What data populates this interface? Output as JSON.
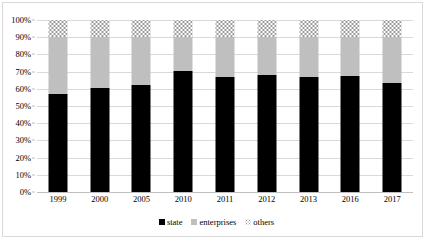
{
  "chart_data": {
    "type": "bar",
    "stacked": true,
    "normalized_percent": true,
    "title": "",
    "subtitle": "",
    "xlabel": "",
    "ylabel": "",
    "ylim": [
      0,
      100
    ],
    "ytick_step": 10,
    "grid": true,
    "legend_position": "bottom",
    "categories": [
      "1999",
      "2000",
      "2005",
      "2010",
      "2011",
      "2012",
      "2013",
      "2016",
      "2017"
    ],
    "ytick_labels": [
      "100%",
      "90%",
      "80%",
      "70%",
      "60%",
      "50%",
      "40%",
      "30%",
      "20%",
      "10%",
      "0%"
    ],
    "ytick_values": [
      100,
      90,
      80,
      70,
      60,
      50,
      40,
      30,
      20,
      10,
      0
    ],
    "series": [
      {
        "name": "state",
        "color": "#000000",
        "pattern": "solid",
        "values": [
          57,
          60.5,
          62.5,
          70.5,
          67,
          68,
          67,
          67.5,
          63.5
        ]
      },
      {
        "name": "enterprises",
        "color": "#bfbfbf",
        "pattern": "solid",
        "values": [
          33,
          29.5,
          27.5,
          19.5,
          23,
          22,
          23,
          22.5,
          26.5
        ]
      },
      {
        "name": "others",
        "color": "#ffffff",
        "pattern": "dotted",
        "values": [
          10,
          10,
          10,
          10,
          10,
          10,
          10,
          10,
          10
        ]
      }
    ]
  },
  "legend": {
    "items": [
      {
        "label": "state"
      },
      {
        "label": "enterprises"
      },
      {
        "label": "others"
      }
    ]
  },
  "colors": {
    "state": "#000000",
    "enterprises": "#bfbfbf",
    "others_dots": "#9a9a9a",
    "gridline": "#d9d9d9",
    "frame_border": "#d9d9d9",
    "background": "#ffffff",
    "text": "#000000"
  }
}
